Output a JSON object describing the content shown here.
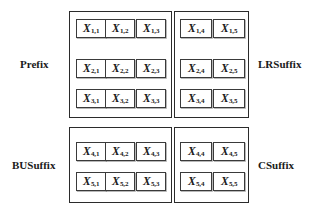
{
  "figure": {
    "colors": {
      "background": "#ffffff",
      "box_border": "#2b2b2b",
      "cell_border": "#3a3a3a",
      "text": "#1a1a1a"
    }
  },
  "labels": {
    "prefix": "Prefix",
    "lrsuffix": "LRSuffix",
    "busuffix": "BUSuffix",
    "csuffix": "CSuffix"
  },
  "groups": [
    {
      "id": "prefix",
      "label": "Prefix",
      "label_position": "left",
      "rows": [
        [
          {
            "var": "X",
            "sub": "1,1"
          },
          {
            "var": "X",
            "sub": "1,2"
          },
          {
            "var": "X",
            "sub": "1,3"
          }
        ],
        [
          {
            "var": "X",
            "sub": "2,1"
          },
          {
            "var": "X",
            "sub": "2,2"
          },
          {
            "var": "X",
            "sub": "2,3"
          }
        ],
        [
          {
            "var": "X",
            "sub": "3,1"
          },
          {
            "var": "X",
            "sub": "3,2"
          },
          {
            "var": "X",
            "sub": "3,3"
          }
        ]
      ]
    },
    {
      "id": "lrsuffix",
      "label": "LRSuffix",
      "label_position": "right",
      "rows": [
        [
          {
            "var": "X",
            "sub": "1,4"
          },
          {
            "var": "X",
            "sub": "1,5"
          }
        ],
        [
          {
            "var": "X",
            "sub": "2,4"
          },
          {
            "var": "X",
            "sub": "2,5"
          }
        ],
        [
          {
            "var": "X",
            "sub": "3,4"
          },
          {
            "var": "X",
            "sub": "3,5"
          }
        ]
      ]
    },
    {
      "id": "busuffix",
      "label": "BUSuffix",
      "label_position": "left",
      "rows": [
        [
          {
            "var": "X",
            "sub": "4,1"
          },
          {
            "var": "X",
            "sub": "4,2"
          },
          {
            "var": "X",
            "sub": "4,3"
          }
        ],
        [
          {
            "var": "X",
            "sub": "5,1"
          },
          {
            "var": "X",
            "sub": "5,2"
          },
          {
            "var": "X",
            "sub": "5,3"
          }
        ]
      ]
    },
    {
      "id": "csuffix",
      "label": "CSuffix",
      "label_position": "right",
      "rows": [
        [
          {
            "var": "X",
            "sub": "4,4"
          },
          {
            "var": "X",
            "sub": "4,5"
          }
        ],
        [
          {
            "var": "X",
            "sub": "5,4"
          },
          {
            "var": "X",
            "sub": "5,5"
          }
        ]
      ]
    }
  ]
}
